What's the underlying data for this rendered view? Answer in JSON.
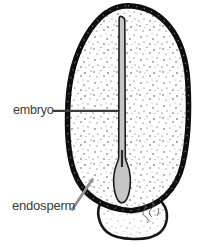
{
  "figure": {
    "type": "biology-seed-section-diagram",
    "labels": {
      "embryo": "embryo",
      "endosperm": "endosperm"
    },
    "colors": {
      "background": "#ffffff",
      "seed_coat_outline": "#0e0e0e",
      "seed_interior": "#ffffff",
      "stipple_dots": "#2e2e2e",
      "embryo_fill": "#c6c6c6",
      "embryo_outline": "#1d1d1d",
      "label_text": "#3a3a3a",
      "embryo_leader_line": "#3c3c3c",
      "endosperm_leader_line": "#909090"
    }
  }
}
